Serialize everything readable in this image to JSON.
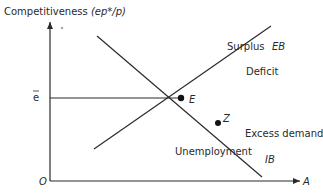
{
  "diagram": {
    "y_axis_label": "Competitiveness (ep*/p)",
    "y_axis_label_main": "Competitiveness ",
    "y_axis_label_var": "(ep*/p)",
    "x_axis_label": "A",
    "origin_label": "O",
    "e_bar_label": "e",
    "curves": {
      "eb": {
        "label": "EB",
        "region_above": "Surplus",
        "region_below": "Deficit"
      },
      "ib": {
        "label": "IB",
        "region_above": "Excess demand",
        "region_below": "Unemployment"
      }
    },
    "points": {
      "e": "E",
      "z": "Z"
    },
    "colors": {
      "line": "#2a2a2a",
      "background": "#ffffff"
    }
  }
}
